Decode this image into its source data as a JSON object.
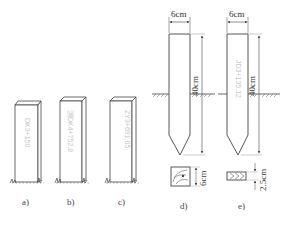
{
  "figure": {
    "panels": [
      {
        "id": "a",
        "caption": "a)",
        "stake_text": "DK3+150"
      },
      {
        "id": "b",
        "caption": "b)",
        "stake_text": "测DK4+752.8"
      },
      {
        "id": "c",
        "caption": "c)",
        "stake_text": "ZY3+691.05"
      },
      {
        "id": "d",
        "caption": "d)",
        "width_label": "6cm",
        "height_label": "40cm",
        "section_label": "6cm"
      },
      {
        "id": "e",
        "caption": "e)",
        "stake_text": "JD3+135.12",
        "width_label": "6cm",
        "height_label": "40cm",
        "section_label": "2.5cm"
      }
    ]
  }
}
